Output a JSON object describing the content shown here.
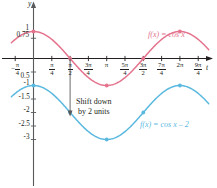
{
  "chart_data": {
    "type": "line",
    "title": "",
    "xlabel": "t",
    "ylabel": "y",
    "xlim": [
      -0.9,
      7.6
    ],
    "ylim": [
      -3.6,
      1.35
    ],
    "grid": false,
    "legend_position": "inline",
    "x_ticks": [
      {
        "value": -0.785,
        "label": "-π/4",
        "num": "π",
        "den": "4",
        "sign": "−"
      },
      {
        "value": 0.785,
        "label": "π/4",
        "num": "π",
        "den": "4",
        "sign": ""
      },
      {
        "value": 1.571,
        "label": "π/2",
        "num": "π",
        "den": "2",
        "sign": ""
      },
      {
        "value": 2.356,
        "label": "3π/4",
        "num": "3π",
        "den": "4",
        "sign": ""
      },
      {
        "value": 3.142,
        "label": "π",
        "num": "π",
        "den": "",
        "sign": ""
      },
      {
        "value": 3.927,
        "label": "5π/4",
        "num": "5π",
        "den": "4",
        "sign": ""
      },
      {
        "value": 4.712,
        "label": "3π/2",
        "num": "3π",
        "den": "2",
        "sign": ""
      },
      {
        "value": 5.498,
        "label": "7π/4",
        "num": "7π",
        "den": "4",
        "sign": ""
      },
      {
        "value": 6.283,
        "label": "2π",
        "num": "2π",
        "den": "",
        "sign": ""
      },
      {
        "value": 7.069,
        "label": "9π/4",
        "num": "9π",
        "den": "4",
        "sign": ""
      }
    ],
    "y_ticks": [
      {
        "value": 1,
        "label": "1"
      },
      {
        "value": 0.75,
        "label": "0.75"
      },
      {
        "value": -0.5,
        "label": "0.5"
      },
      {
        "value": -1,
        "label": "-1"
      },
      {
        "value": -1.5,
        "label": "-1.5"
      },
      {
        "value": -2,
        "label": "-2"
      },
      {
        "value": -2.5,
        "label": "-2.5"
      },
      {
        "value": -3,
        "label": "-3"
      }
    ],
    "series": [
      {
        "name": "f(x) = cos x",
        "label": "f(x) = cos x",
        "color": "#e4738d",
        "equation": "cos(x)",
        "amplitude": 1,
        "vertical_shift": 0,
        "points": [
          {
            "x": 0,
            "y": 1
          },
          {
            "x": 1.571,
            "y": 0
          },
          {
            "x": 3.142,
            "y": -1
          },
          {
            "x": 4.712,
            "y": 0
          },
          {
            "x": 6.283,
            "y": 1
          }
        ]
      },
      {
        "name": "f(x) = cos x - 2",
        "label": "f(x) = cos x – 2",
        "color": "#5bb9df",
        "equation": "cos(x)-2",
        "amplitude": 1,
        "vertical_shift": -2,
        "points": [
          {
            "x": 0,
            "y": -1
          },
          {
            "x": 1.571,
            "y": -2
          },
          {
            "x": 3.142,
            "y": -3
          },
          {
            "x": 4.712,
            "y": -2
          },
          {
            "x": 6.283,
            "y": -1
          }
        ]
      }
    ],
    "annotations": [
      {
        "name": "shift-annotation",
        "line1": "Shift down",
        "line2": "by 2 units",
        "arrow_from": {
          "x": 1.571,
          "y": 0
        },
        "arrow_to": {
          "x": 1.571,
          "y": -2
        }
      }
    ]
  },
  "axes": {
    "y_axis_name": "y",
    "x_axis_name": "t"
  }
}
